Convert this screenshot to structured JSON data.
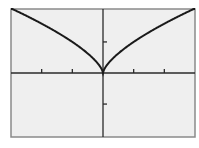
{
  "chart_data": {
    "type": "line",
    "title": "",
    "function": "y = x^(2/3)",
    "xlabel": "",
    "ylabel": "",
    "xlim": [
      -3,
      3
    ],
    "ylim": [
      -2.06,
      2.06
    ],
    "x_ticks": [
      -2,
      -1,
      1,
      2
    ],
    "y_ticks": [
      -1,
      1
    ],
    "grid": false,
    "legend": null,
    "series": [
      {
        "name": "y = x^(2/3)",
        "x": [
          -3,
          -2.5,
          -2,
          -1.5,
          -1,
          -0.5,
          -0.1,
          0,
          0.1,
          0.5,
          1,
          1.5,
          2,
          2.5,
          3
        ],
        "y": [
          2.08,
          1.84,
          1.59,
          1.31,
          1.0,
          0.63,
          0.22,
          0,
          0.22,
          0.63,
          1.0,
          1.31,
          1.59,
          1.84,
          2.08
        ]
      }
    ],
    "colors": {
      "background": "#efefef",
      "frame": "#8a8a8a",
      "axis": "#2a2a2a",
      "curve": "#1a1a1a"
    }
  }
}
